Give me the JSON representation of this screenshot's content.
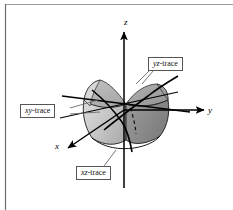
{
  "figure": {
    "kind": "3d-surface-diagram",
    "background_color": "#ffffff",
    "frame": {
      "top_rule_color": "#9a9a9a",
      "left_rule_color": "#6e6e6e"
    },
    "axes": {
      "z": {
        "label": "z",
        "direction": "up"
      },
      "y": {
        "label": "y",
        "direction": "right"
      },
      "x": {
        "label": "x",
        "direction": "down-left"
      },
      "axis_color": "#000000"
    },
    "callouts": [
      {
        "id": "xy-trace",
        "italic_part": "xy",
        "roman_part": "-trace",
        "full_text": "xy-trace",
        "box_color": "#555555",
        "fill_color": "#ffffff"
      },
      {
        "id": "yz-trace",
        "italic_part": "yz",
        "roman_part": "-trace",
        "full_text": "yz-trace",
        "box_color": "#555555",
        "fill_color": "#ffffff"
      },
      {
        "id": "xz-trace",
        "italic_part": "xz",
        "roman_part": "-trace",
        "full_text": "xz-trace",
        "box_color": "#555555",
        "fill_color": "#ffffff"
      }
    ],
    "surface": {
      "type": "saddle",
      "front_left_fill": "#c9c9c9",
      "front_right_fill": "#8f8f8f",
      "back_left_fill": "#b4b4b4",
      "back_right_fill": "#a0a0a0",
      "outline_color": "#1a1a1a",
      "hidden_curve_style": "dashed"
    }
  }
}
